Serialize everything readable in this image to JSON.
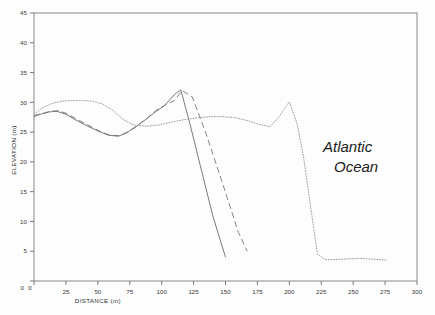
{
  "chart_data": {
    "type": "line",
    "title": "",
    "xlabel": "DISTANCE   (m)",
    "ylabel": "ELEVATION  (m)",
    "xlim": [
      0,
      300
    ],
    "ylim": [
      0,
      45
    ],
    "xticks": [
      0,
      25,
      50,
      75,
      100,
      125,
      150,
      175,
      200,
      225,
      250,
      275,
      300
    ],
    "yticks": [
      0,
      5,
      10,
      15,
      20,
      25,
      30,
      35,
      40,
      45
    ],
    "xtick_labels": [
      "0",
      "25",
      "50",
      "75",
      "100",
      "125",
      "150",
      "175",
      "200",
      "225",
      "250",
      "275",
      "300"
    ],
    "ytick_labels": [
      "0",
      "5",
      "10",
      "15",
      "20",
      "25",
      "30",
      "35",
      "40",
      "45"
    ],
    "grid": false,
    "legend": "none",
    "annotations": [
      {
        "name": "atlantic-ocean-label",
        "line1": "Atlantic",
        "line2": "Ocean",
        "x": 245,
        "y": 22.5
      }
    ],
    "series": [
      {
        "name": "profile-solid",
        "style": "solid",
        "color": "#6b6b6b",
        "x": [
          0,
          5,
          12,
          18,
          25,
          33,
          42,
          50,
          58,
          66,
          72,
          80,
          88,
          95,
          102,
          110,
          115,
          122,
          130,
          140,
          150
        ],
        "y": [
          27.6,
          28.0,
          28.4,
          28.5,
          28.0,
          27.0,
          26.0,
          25.2,
          24.5,
          24.3,
          24.8,
          25.9,
          27.2,
          28.4,
          29.4,
          31.3,
          32.1,
          26.5,
          19.6,
          11.0,
          4.0
        ]
      },
      {
        "name": "profile-dashed",
        "style": "dashed",
        "color": "#757575",
        "x": [
          0,
          6,
          13,
          19,
          26,
          34,
          43,
          51,
          59,
          67,
          73,
          81,
          89,
          96,
          103,
          110,
          116,
          124,
          135,
          148,
          160,
          167
        ],
        "y": [
          27.8,
          28.1,
          28.5,
          28.6,
          28.1,
          27.1,
          26.1,
          25.2,
          24.5,
          24.4,
          25.0,
          26.1,
          27.4,
          28.7,
          29.6,
          30.3,
          32.0,
          30.9,
          24.6,
          16.2,
          8.2,
          5.0
        ]
      },
      {
        "name": "profile-dotted",
        "style": "dotted",
        "color": "#9a9a9a",
        "x": [
          0,
          6,
          14,
          22,
          30,
          38,
          46,
          54,
          62,
          70,
          78,
          88,
          98,
          108,
          118,
          128,
          138,
          148,
          158,
          168,
          176,
          185,
          192,
          200,
          206,
          211,
          215,
          219,
          222,
          228,
          236,
          245,
          255,
          262,
          270,
          276
        ],
        "y": [
          28.0,
          29.0,
          29.8,
          30.2,
          30.3,
          30.3,
          30.2,
          29.7,
          28.6,
          27.1,
          26.2,
          26.0,
          26.2,
          26.7,
          27.1,
          27.4,
          27.6,
          27.6,
          27.4,
          26.9,
          26.3,
          25.9,
          27.6,
          30.1,
          26.5,
          21.0,
          15.0,
          9.0,
          4.5,
          3.6,
          3.6,
          3.7,
          3.8,
          3.7,
          3.6,
          3.5
        ]
      }
    ]
  }
}
